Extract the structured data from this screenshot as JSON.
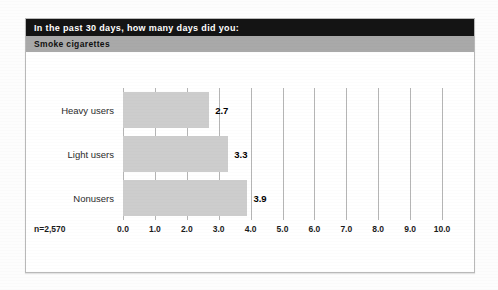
{
  "figure": {
    "title": "In the past 30 days, how many days did you:",
    "subtitle": "Smoke cigarettes",
    "sample_size_label": "n=2,570",
    "colors": {
      "title_band": "#141414",
      "subtitle_band": "#a9a9a9",
      "bar_fill": "#cdcdcd",
      "gridline": "#b5b5b5",
      "panel_border": "#b9b9b9"
    }
  },
  "chart_data": {
    "type": "bar",
    "orientation": "horizontal",
    "title": "In the past 30 days, how many days did you: Smoke cigarettes",
    "categories": [
      "Heavy users",
      "Light users",
      "Nonusers"
    ],
    "values": [
      2.7,
      3.3,
      3.9
    ],
    "value_labels": [
      "2.7",
      "3.3",
      "3.9"
    ],
    "xlabel": "",
    "ylabel": "",
    "xlim": [
      0.0,
      10.0
    ],
    "xticks": [
      0.0,
      1.0,
      2.0,
      3.0,
      4.0,
      5.0,
      6.0,
      7.0,
      8.0,
      9.0,
      10.0
    ],
    "xtick_labels": [
      "0.0",
      "1.0",
      "2.0",
      "3.0",
      "4.0",
      "5.0",
      "6.0",
      "7.0",
      "8.0",
      "9.0",
      "10.0"
    ],
    "grid": true,
    "grid_axis": "x",
    "legend": false,
    "annotations": [
      "n=2,570"
    ]
  }
}
